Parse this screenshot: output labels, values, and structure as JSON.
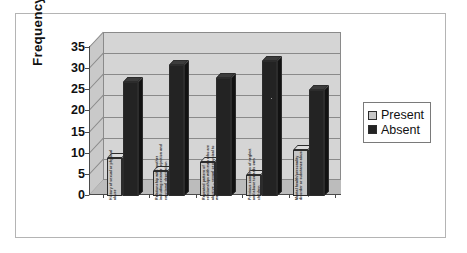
{
  "chart_data": {
    "type": "bar",
    "title": "",
    "xlabel": "",
    "ylabel": "Frequency",
    "ylim": [
      0,
      35
    ],
    "yticks": [
      0,
      5,
      10,
      15,
      20,
      25,
      30,
      35
    ],
    "grid": true,
    "legend_position": "right",
    "categories": [
      "History of sexual or physical abuse",
      "Relationship with mother including extreme rejection and emotional deprivation",
      "Repeated pattern of relationships with men who are abusive – sexual or physical to women or child",
      "Previous concerns of neglect and abuse towards own children",
      "Mental health/personality disorder or substance abuse"
    ],
    "series": [
      {
        "name": "Present",
        "color": "#c6c6c6",
        "values": [
          9,
          6,
          8,
          5,
          11
        ]
      },
      {
        "name": "Absent",
        "color": "#232323",
        "values": [
          27,
          31,
          28,
          32,
          25
        ]
      }
    ]
  },
  "axes": {
    "y_title": "Frequency",
    "y_tick_labels": [
      "35",
      "30",
      "25",
      "20",
      "15",
      "10",
      "5",
      "0"
    ]
  },
  "legend": {
    "items": [
      {
        "label": "Present",
        "swatch": "present"
      },
      {
        "label": "Absent",
        "swatch": "absent"
      }
    ]
  }
}
